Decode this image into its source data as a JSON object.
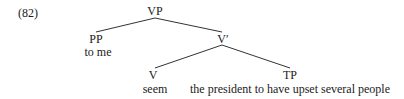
{
  "example_number": "(82)",
  "tree": {
    "root": {
      "label": "VP"
    },
    "pp": {
      "label": "PP",
      "text": "to me"
    },
    "vbar": {
      "label": "V′"
    },
    "v": {
      "label": "V",
      "text": "seem"
    },
    "tp": {
      "label": "TP",
      "text": "the president to have upset several people"
    }
  }
}
